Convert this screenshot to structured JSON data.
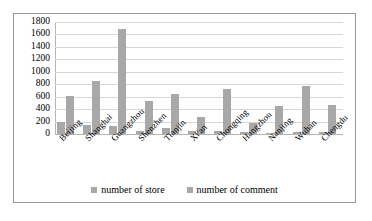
{
  "chart_data": {
    "type": "bar",
    "title": "",
    "xlabel": "",
    "ylabel": "",
    "ylim": [
      0,
      1800
    ],
    "ytick_step": 200,
    "yticks": [
      1800,
      1600,
      1400,
      1200,
      1000,
      800,
      600,
      400,
      200,
      0
    ],
    "grid": true,
    "legend_position": "bottom",
    "categories": [
      "Beijing",
      "Shanghai",
      "Guangzhou",
      "Shenzhen",
      "Tianjin",
      "Xi'an",
      "Chongqing",
      "Hangzhou",
      "Nanjing",
      "Wuhan",
      "Chengdu"
    ],
    "series": [
      {
        "name": "number of store",
        "color": "#a8a8a8",
        "values": [
          195,
          150,
          130,
          50,
          95,
          50,
          45,
          30,
          20,
          40,
          30
        ]
      },
      {
        "name": "number of comment",
        "color": "#a8a8a8",
        "values": [
          605,
          855,
          1680,
          530,
          650,
          280,
          725,
          180,
          450,
          770,
          470
        ]
      }
    ]
  },
  "legend": {
    "items": [
      {
        "label": "number of store"
      },
      {
        "label": "number of comment"
      }
    ]
  },
  "colors": {
    "bar": "#a8a8a8",
    "grid": "#d7d7d7",
    "axis": "#b5b5b5",
    "frame": "#9a9a9a",
    "background": "#ffffff"
  }
}
